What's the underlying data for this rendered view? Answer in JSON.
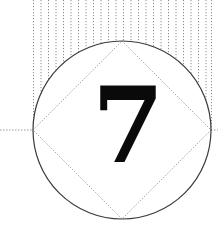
{
  "figure": {
    "numeral": "7",
    "colors": {
      "background": "#ffffff",
      "circle_stroke": "#3a3a3a",
      "dotted_lines": "#9a9a9a",
      "hatching": "#8c8c8c",
      "numeral": "#0a0a0a"
    },
    "circle": {
      "cx": 122,
      "cy": 130,
      "r": 89
    },
    "diamond": {
      "top": [
        122,
        41
      ],
      "right": [
        211,
        130
      ],
      "bottom": [
        122,
        219
      ],
      "left": [
        33,
        130
      ]
    },
    "hatching": {
      "x_start": 33,
      "x_end": 212,
      "y_top": 0,
      "y_bottom": 130,
      "spacing": 7.5
    },
    "horizontal_guide": {
      "left": {
        "x1": 0,
        "x2": 33,
        "y": 130
      },
      "right": {
        "x1": 211,
        "x2": 218,
        "y": 130
      }
    }
  }
}
